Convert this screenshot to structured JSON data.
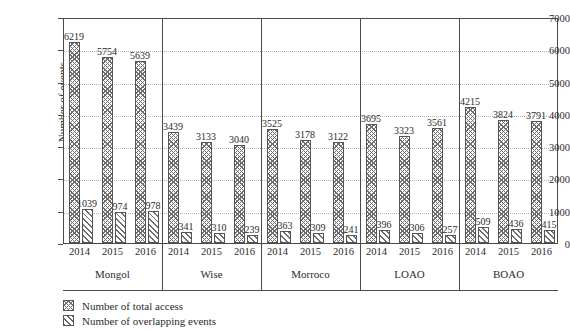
{
  "chart_data": {
    "type": "bar",
    "title": "",
    "xlabel": "",
    "ylabel": "Number of events",
    "ylim": [
      0,
      7000
    ],
    "ytick_step": 1000,
    "yticks": [
      "0",
      "1000",
      "2000",
      "3000",
      "4000",
      "5000",
      "6000",
      "7000"
    ],
    "grid": true,
    "legend_position": "bottom-left",
    "groups": [
      "Mongol",
      "Wise",
      "Morroco",
      "LOAO",
      "BOAO"
    ],
    "categories": [
      "2014",
      "2015",
      "2016",
      "2014",
      "2015",
      "2016",
      "2014",
      "2015",
      "2016",
      "2014",
      "2015",
      "2016",
      "2014",
      "2015",
      "2016"
    ],
    "series": [
      {
        "name": "Number of total access",
        "pattern": "crosshatch",
        "values": [
          6219,
          5754,
          5639,
          3439,
          3133,
          3040,
          3525,
          3178,
          3122,
          3695,
          3323,
          3561,
          4215,
          3824,
          3791
        ]
      },
      {
        "name": "Number of overlapping events",
        "pattern": "diagonal-hatch",
        "values": [
          1039,
          974,
          978,
          341,
          310,
          239,
          363,
          309,
          241,
          396,
          306,
          257,
          509,
          436,
          415
        ]
      }
    ],
    "grouped_detail": [
      {
        "group": "Mongol",
        "years": [
          {
            "year": "2014",
            "total_access": 6219,
            "overlapping_events": 1039
          },
          {
            "year": "2015",
            "total_access": 5754,
            "overlapping_events": 974
          },
          {
            "year": "2016",
            "total_access": 5639,
            "overlapping_events": 978
          }
        ]
      },
      {
        "group": "Wise",
        "years": [
          {
            "year": "2014",
            "total_access": 3439,
            "overlapping_events": 341
          },
          {
            "year": "2015",
            "total_access": 3133,
            "overlapping_events": 310
          },
          {
            "year": "2016",
            "total_access": 3040,
            "overlapping_events": 239
          }
        ]
      },
      {
        "group": "Morroco",
        "years": [
          {
            "year": "2014",
            "total_access": 3525,
            "overlapping_events": 363
          },
          {
            "year": "2015",
            "total_access": 3178,
            "overlapping_events": 309
          },
          {
            "year": "2016",
            "total_access": 3122,
            "overlapping_events": 241
          }
        ]
      },
      {
        "group": "LOAO",
        "years": [
          {
            "year": "2014",
            "total_access": 3695,
            "overlapping_events": 396
          },
          {
            "year": "2015",
            "total_access": 3323,
            "overlapping_events": 306
          },
          {
            "year": "2016",
            "total_access": 3561,
            "overlapping_events": 257
          }
        ]
      },
      {
        "group": "BOAO",
        "years": [
          {
            "year": "2014",
            "total_access": 4215,
            "overlapping_events": 509
          },
          {
            "year": "2015",
            "total_access": 3824,
            "overlapping_events": 436
          },
          {
            "year": "2016",
            "total_access": 3791,
            "overlapping_events": 415
          }
        ]
      }
    ],
    "legend": [
      {
        "label": "Number of total access",
        "pattern": "crosshatch"
      },
      {
        "label": "Number of overlapping events",
        "pattern": "diagonal-hatch"
      }
    ],
    "colors": {
      "hatch": "#6e6e6e",
      "bar_border": "#555555",
      "axis": "#4a4a4a",
      "gridline": "#b4b4b4",
      "background": "#ffffff",
      "text": "#2b2b2b"
    }
  }
}
